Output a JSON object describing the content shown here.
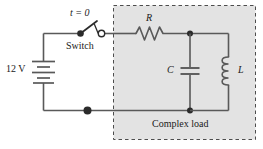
{
  "figure": {
    "type": "circuit-schematic",
    "background": "#ffffff",
    "wire_color": "#555555",
    "load_box_fill": "#e2e2e2",
    "load_box_stroke": "#555555",
    "text_color": "#1a1a1a"
  },
  "source": {
    "label": "12 V",
    "component": "battery"
  },
  "switch": {
    "time_label": "t = 0",
    "name_label": "Switch",
    "state": "open"
  },
  "load": {
    "box_label": "Complex load",
    "components": [
      {
        "symbol": "R",
        "type": "resistor",
        "orientation": "horizontal"
      },
      {
        "symbol": "C",
        "type": "capacitor",
        "orientation": "vertical"
      },
      {
        "symbol": "L",
        "type": "inductor",
        "orientation": "vertical"
      }
    ],
    "resistor_label": "R",
    "capacitor_label": "C",
    "inductor_label": "L"
  }
}
